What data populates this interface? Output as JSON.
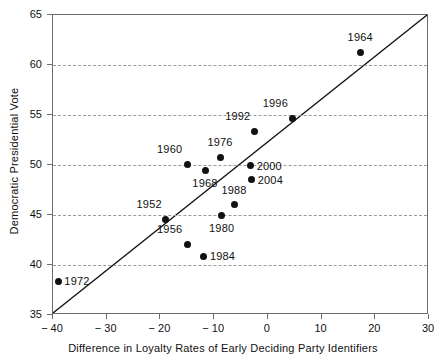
{
  "chart_data": {
    "type": "scatter",
    "title": "",
    "xlabel": "Difference in Loyalty Rates of Early Deciding Party Identifiers",
    "ylabel": "Democratic Presidential Vote",
    "xlim": [
      -40,
      30
    ],
    "ylim": [
      35,
      65
    ],
    "xticks": [
      -40,
      -30,
      -20,
      -10,
      0,
      10,
      20,
      30
    ],
    "xticklabels": [
      "− 40",
      "− 30",
      "− 20",
      "− 10",
      "0",
      "10",
      "20",
      "30"
    ],
    "yticks": [
      35,
      40,
      45,
      50,
      55,
      60,
      65
    ],
    "yticklabels": [
      "35",
      "40",
      "45",
      "50",
      "55",
      "60",
      "65"
    ],
    "grid": "horizontal-dashed",
    "gridlines_y": [
      40,
      45,
      50,
      55,
      60
    ],
    "legend": "none",
    "reference_line": {
      "name": "45-degree-diagonal",
      "from": [
        -40,
        35
      ],
      "to": [
        30,
        65
      ]
    },
    "point_color": "#111111",
    "grid_color": "#9a9a9a",
    "frame_color": "#6e6e6e",
    "points": [
      {
        "label": "1952",
        "x": -19.0,
        "y": 44.6,
        "label_dx": -4,
        "label_dy": -15,
        "label_anchor": "end"
      },
      {
        "label": "1956",
        "x": -15.0,
        "y": 42.1,
        "label_dx": -5,
        "label_dy": -15,
        "label_anchor": "end"
      },
      {
        "label": "1960",
        "x": -15.0,
        "y": 50.1,
        "label_dx": -5,
        "label_dy": -15,
        "label_anchor": "end"
      },
      {
        "label": "1964",
        "x": 17.2,
        "y": 61.3,
        "label_dx": 0,
        "label_dy": -15,
        "label_anchor": "middle"
      },
      {
        "label": "1968",
        "x": -11.7,
        "y": 49.5,
        "label_dx": 0,
        "label_dy": 13,
        "label_anchor": "middle"
      },
      {
        "label": "1972",
        "x": -39.0,
        "y": 38.4,
        "label_dx": 6,
        "label_dy": 0,
        "label_anchor": "start"
      },
      {
        "label": "1976",
        "x": -8.9,
        "y": 50.8,
        "label_dx": 0,
        "label_dy": -15,
        "label_anchor": "middle"
      },
      {
        "label": "1980",
        "x": -8.6,
        "y": 45.0,
        "label_dx": 0,
        "label_dy": 13,
        "label_anchor": "middle"
      },
      {
        "label": "1984",
        "x": -11.9,
        "y": 40.9,
        "label_dx": 6,
        "label_dy": 0,
        "label_anchor": "start"
      },
      {
        "label": "1988",
        "x": -6.3,
        "y": 46.1,
        "label_dx": 0,
        "label_dy": -14,
        "label_anchor": "middle"
      },
      {
        "label": "1992",
        "x": -2.5,
        "y": 53.4,
        "label_dx": -4,
        "label_dy": -15,
        "label_anchor": "end"
      },
      {
        "label": "1996",
        "x": 4.5,
        "y": 54.7,
        "label_dx": -4,
        "label_dy": -15,
        "label_anchor": "end"
      },
      {
        "label": "2000",
        "x": -3.2,
        "y": 50.0,
        "label_dx": 6,
        "label_dy": 1,
        "label_anchor": "start"
      },
      {
        "label": "2004",
        "x": -3.0,
        "y": 48.6,
        "label_dx": 6,
        "label_dy": 1,
        "label_anchor": "start"
      }
    ]
  }
}
